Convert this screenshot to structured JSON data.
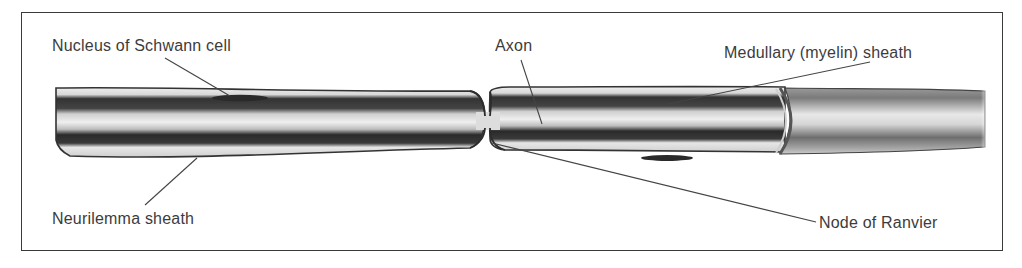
{
  "diagram": {
    "labels": [
      {
        "id": "schwann-nucleus",
        "text": "Nucleus of Schwann cell"
      },
      {
        "id": "axon",
        "text": "Axon"
      },
      {
        "id": "medullary-sheath",
        "text": "Medullary (myelin) sheath"
      },
      {
        "id": "neurilemma-sheath",
        "text": "Neurilemma sheath"
      },
      {
        "id": "node-of-ranvier",
        "text": "Node of Ranvier"
      }
    ]
  },
  "colors": {
    "ink": "#3c3c3c",
    "frame": "#3a3a3a",
    "dark_band": "#2e2e2e",
    "light_band": "#e4e4e4",
    "background": "#ffffff"
  }
}
